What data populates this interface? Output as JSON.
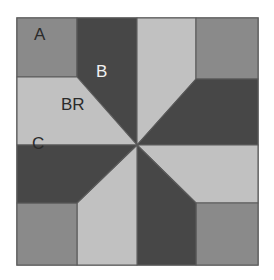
{
  "diagram": {
    "kind": "quilt-block-piecing-diagram",
    "canvas": {
      "width": 274,
      "height": 280,
      "background": "#ffffff"
    },
    "frame": {
      "name": "block-outline",
      "x": 17,
      "y": 18,
      "width": 241,
      "height": 247,
      "fill": "#ffffff",
      "stroke": "#6e6e6e",
      "stroke_width": 1.6
    },
    "colors": {
      "medium_gray": "#8a8a8a",
      "light_gray": "#c1c1c1",
      "dark_gray": "#474747",
      "background_white": "#ffffff",
      "outline": "#5b5b5b",
      "frame": "#6e6e6e",
      "label_dark": "#2b2b2b",
      "label_light": "#f2f2f2"
    },
    "geometry": {
      "center": {
        "x": 137,
        "y": 145
      },
      "corners": {
        "top_left": {
          "x": 17,
          "y": 18
        },
        "top_right": {
          "x": 258,
          "y": 18
        },
        "bottom_right": {
          "x": 258,
          "y": 265
        },
        "bottom_left": {
          "x": 17,
          "y": 265
        }
      },
      "edge_points": {
        "top_left_of_top": {
          "x": 77,
          "y": 18
        },
        "top_right_of_top": {
          "x": 196,
          "y": 18
        },
        "right_top_of_right": {
          "x": 258,
          "y": 79
        },
        "right_bottom_of_right": {
          "x": 258,
          "y": 203
        },
        "bottom_right_of_bottom": {
          "x": 196,
          "y": 265
        },
        "bottom_left_of_bottom": {
          "x": 77,
          "y": 265
        },
        "left_bottom_of_left": {
          "x": 17,
          "y": 203
        },
        "left_top_of_left": {
          "x": 17,
          "y": 77
        }
      }
    },
    "patches": [
      {
        "id": "tl-corner-triangle",
        "name": "patch-a-top-left",
        "shade": "medium_gray",
        "points": "17,18 77,18 77,77 17,77"
      },
      {
        "id": "tl-dark-kite",
        "name": "patch-b-top-left",
        "shade": "dark_gray",
        "points": "77,18 137,18 137,145 77,77"
      },
      {
        "id": "tl-light-kite",
        "name": "patch-br-top-left",
        "shade": "light_gray",
        "points": "17,77 77,77 137,145 17,145"
      },
      {
        "id": "tr-light-kite",
        "name": "patch-br-top-right",
        "shade": "light_gray",
        "points": "137,18 196,18 196,79 137,145"
      },
      {
        "id": "tr-corner-triangle",
        "name": "patch-a-top-right",
        "shade": "medium_gray",
        "points": "196,18 258,18 258,79 196,79"
      },
      {
        "id": "tr-dark-kite",
        "name": "patch-b-top-right",
        "shade": "dark_gray",
        "points": "196,79 258,79 258,145 137,145"
      },
      {
        "id": "br-light-kite",
        "name": "patch-br-bottom-right",
        "shade": "light_gray",
        "points": "258,145 258,203 196,203 137,145"
      },
      {
        "id": "br-corner-triangle",
        "name": "patch-a-bottom-right",
        "shade": "medium_gray",
        "points": "258,203 258,265 196,265 196,203"
      },
      {
        "id": "br-dark-kite",
        "name": "patch-b-bottom-right",
        "shade": "dark_gray",
        "points": "137,145 196,203 196,265 137,265"
      },
      {
        "id": "bl-light-kite",
        "name": "patch-br-bottom-left",
        "shade": "light_gray",
        "points": "137,145 137,265 77,265 77,203"
      },
      {
        "id": "bl-corner-triangle",
        "name": "patch-a-bottom-left",
        "shade": "medium_gray",
        "points": "17,203 77,203 77,265 17,265"
      },
      {
        "id": "bl-dark-kite",
        "name": "patch-b-bottom-left",
        "shade": "dark_gray",
        "points": "17,145 137,145 77,203 17,203"
      }
    ],
    "labels": [
      {
        "id": "label-a",
        "name": "patch-label-a",
        "text": "A",
        "x": 34,
        "y": 40,
        "tone": "label_dark"
      },
      {
        "id": "label-b",
        "name": "patch-label-b",
        "text": "B",
        "x": 96,
        "y": 77,
        "tone": "label_light"
      },
      {
        "id": "label-br",
        "name": "patch-label-br",
        "text": "BR",
        "x": 61,
        "y": 110,
        "tone": "label_dark"
      },
      {
        "id": "label-c",
        "name": "patch-label-c",
        "text": "C",
        "x": 32,
        "y": 149,
        "tone": "label_dark"
      }
    ]
  }
}
